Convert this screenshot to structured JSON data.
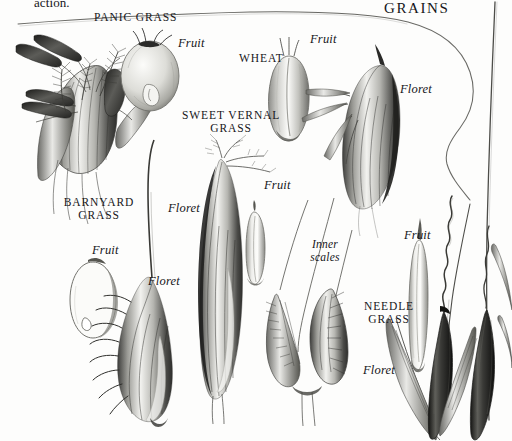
{
  "plate": {
    "running_text": "action.",
    "title": "GRAINS",
    "background_color": "#fdfdfc",
    "ink_color": "#16161a"
  },
  "species_labels": [
    {
      "name": "panic-grass",
      "text": "PANIC GRASS"
    },
    {
      "name": "wheat",
      "text": "WHEAT"
    },
    {
      "name": "sweet-vernal-grass",
      "text": "SWEET VERNAL\nGRASS"
    },
    {
      "name": "barnyard-grass",
      "text": "BARNYARD\nGRASS"
    },
    {
      "name": "needle-grass",
      "text": "NEEDLE\nGRASS"
    }
  ],
  "part_labels": [
    {
      "name": "panic-grass-fruit",
      "text": "Fruit"
    },
    {
      "name": "wheat-fruit",
      "text": "Fruit"
    },
    {
      "name": "wheat-floret",
      "text": "Floret"
    },
    {
      "name": "sweet-vernal-grass-floret",
      "text": "Floret"
    },
    {
      "name": "sweet-vernal-grass-fruit",
      "text": "Fruit"
    },
    {
      "name": "inner-scales",
      "text": "Inner\nscales"
    },
    {
      "name": "barnyard-grass-fruit",
      "text": "Fruit"
    },
    {
      "name": "barnyard-grass-floret",
      "text": "Floret"
    },
    {
      "name": "needle-grass-fruit",
      "text": "Fruit"
    },
    {
      "name": "needle-grass-floret",
      "text": "Floret"
    }
  ]
}
